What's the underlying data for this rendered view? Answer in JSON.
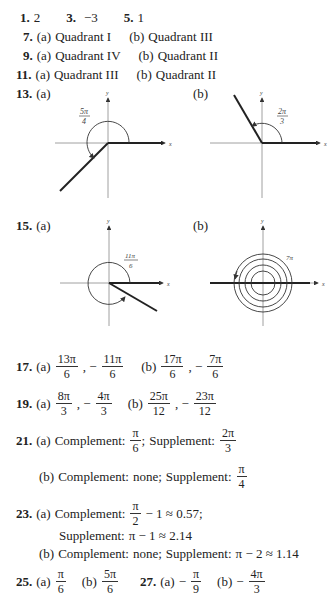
{
  "answers": {
    "p1": {
      "num": "1.",
      "val": "2"
    },
    "p3": {
      "num": "3.",
      "val": "−3"
    },
    "p5": {
      "num": "5.",
      "val": "1"
    },
    "p7": {
      "num": "7.",
      "a_label": "(a)",
      "a": "Quadrant I",
      "b_label": "(b)",
      "b": "Quadrant III"
    },
    "p9": {
      "num": "9.",
      "a_label": "(a)",
      "a": "Quadrant IV",
      "b_label": "(b)",
      "b": "Quadrant II"
    },
    "p11": {
      "num": "11.",
      "a_label": "(a)",
      "a": "Quadrant III",
      "b_label": "(b)",
      "b": "Quadrant II"
    },
    "p13": {
      "num": "13.",
      "a_label": "(a)",
      "b_label": "(b)",
      "a_angle": {
        "num": "5π",
        "den": "4"
      },
      "b_angle": {
        "num": "2π",
        "den": "3"
      }
    },
    "p15": {
      "num": "15.",
      "a_label": "(a)",
      "b_label": "(b)",
      "a_angle": {
        "num": "11π",
        "den": "6"
      },
      "b_angle": "7π"
    },
    "p17": {
      "num": "17.",
      "a_label": "(a)",
      "b_label": "(b)",
      "a1": {
        "num": "13π",
        "den": "6"
      },
      "a2": {
        "num": "11π",
        "den": "6"
      },
      "b1": {
        "num": "17π",
        "den": "6"
      },
      "b2": {
        "num": "7π",
        "den": "6"
      }
    },
    "p19": {
      "num": "19.",
      "a_label": "(a)",
      "b_label": "(b)",
      "a1": {
        "num": "8π",
        "den": "3"
      },
      "a2": {
        "num": "4π",
        "den": "3"
      },
      "b1": {
        "num": "25π",
        "den": "12"
      },
      "b2": {
        "num": "23π",
        "den": "12"
      }
    },
    "p21": {
      "num": "21.",
      "a_label": "(a)",
      "b_label": "(b)",
      "complement": "Complement:",
      "supplement": "Supplement:",
      "a_comp": {
        "num": "π",
        "den": "6"
      },
      "a_supp": {
        "num": "2π",
        "den": "3"
      },
      "b_comp": "none;",
      "b_supp": {
        "num": "π",
        "den": "4"
      }
    },
    "p23": {
      "num": "23.",
      "a_label": "(a)",
      "b_label": "(b)",
      "complement": "Complement:",
      "supplement": "Supplement:",
      "a_comp_frac": {
        "num": "π",
        "den": "2"
      },
      "a_comp_rest": "− 1 ≈ 0.57;",
      "a_supp": "π − 1 ≈ 2.14",
      "b_comp": "none;",
      "b_supp": "π − 2 ≈ 1.14"
    },
    "p25": {
      "num": "25.",
      "a_label": "(a)",
      "b_label": "(b)",
      "a": {
        "num": "π",
        "den": "6"
      },
      "b": {
        "num": "5π",
        "den": "6"
      }
    },
    "p27": {
      "num": "27.",
      "a_label": "(a)",
      "b_label": "(b)",
      "a": {
        "num": "π",
        "den": "9"
      },
      "b": {
        "num": "4π",
        "den": "3"
      }
    }
  },
  "axes": {
    "x": "x",
    "y": "y"
  }
}
